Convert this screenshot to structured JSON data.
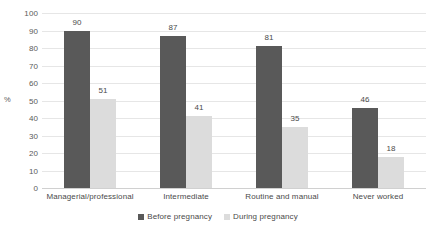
{
  "chart_data": {
    "type": "bar",
    "title": "",
    "subtitle": "",
    "xlabel": "",
    "ylabel": "%",
    "ylim": [
      0,
      100
    ],
    "ytick_step": 10,
    "yticks": [
      "100",
      "90",
      "80",
      "70",
      "60",
      "50",
      "40",
      "30",
      "20",
      "10",
      "0"
    ],
    "grid": true,
    "legend_position": "bottom-center",
    "categories": [
      "Managerial/professional",
      "Intermediate",
      "Routine and manual",
      "Never worked"
    ],
    "series": [
      {
        "name": "Before pregnancy",
        "color": "#595959",
        "values": [
          90,
          87,
          81,
          46
        ],
        "labels": [
          "90",
          "87",
          "81",
          "46"
        ]
      },
      {
        "name": "During pregnancy",
        "color": "#dcdcdc",
        "values": [
          51,
          41,
          35,
          18
        ],
        "labels": [
          "51",
          "41",
          "35",
          "18"
        ]
      }
    ]
  }
}
